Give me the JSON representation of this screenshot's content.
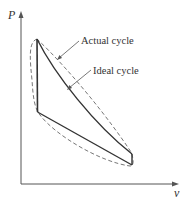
{
  "diagram": {
    "type": "P-v diagram",
    "axes": {
      "y_label": "P",
      "x_label": "v"
    },
    "annotations": [
      {
        "label": "Actual cycle",
        "style": "dashed"
      },
      {
        "label": "Ideal cycle",
        "style": "solid"
      }
    ],
    "colors": {
      "ideal": "#333333",
      "actual": "#666666",
      "axis": "#555555",
      "background": "#ffffff"
    }
  }
}
